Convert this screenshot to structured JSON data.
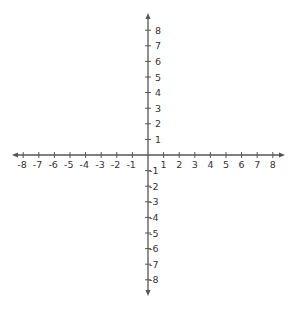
{
  "diagram": {
    "type": "coordinate-plane",
    "x_axis": {
      "min": -8,
      "max": 8,
      "tick_labels": [
        "-8",
        "-7",
        "-6",
        "-5",
        "-4",
        "-3",
        "-2",
        "-1",
        "1",
        "2",
        "3",
        "4",
        "5",
        "6",
        "7",
        "8"
      ],
      "arrows": "both"
    },
    "y_axis": {
      "min": -8,
      "max": 8,
      "tick_labels": [
        "8",
        "7",
        "6",
        "5",
        "4",
        "3",
        "2",
        "1",
        "-1",
        "-2",
        "-3",
        "-4",
        "-5",
        "-6",
        "-7",
        "-8"
      ],
      "arrows": "both"
    },
    "colors": {
      "axis": "#555555",
      "label": "#333333",
      "background": "#ffffff"
    }
  },
  "layout": {
    "origin_x": 148,
    "origin_y": 155,
    "unit": 15.6,
    "x_arrow_left": 12,
    "x_arrow_right": 285,
    "y_arrow_top": 13,
    "y_arrow_bottom": 296
  }
}
